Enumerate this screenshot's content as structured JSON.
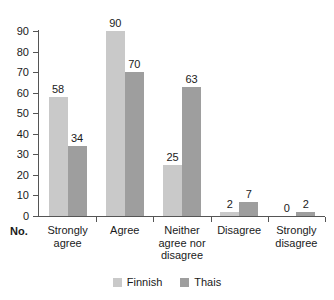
{
  "chart_data": {
    "type": "bar",
    "title": "",
    "subtitle": "",
    "xlabel": "No.",
    "ylabel": "",
    "categories": [
      "Strongly agree",
      "Agree",
      "Neither agree nor disagree",
      "Disagree",
      "Strongly disagree"
    ],
    "category_lines": [
      [
        "Strongly",
        "agree"
      ],
      [
        "Agree"
      ],
      [
        "Neither",
        "agree nor",
        "disagree"
      ],
      [
        "Disagree"
      ],
      [
        "Strongly",
        "disagree"
      ]
    ],
    "series": [
      {
        "name": "Finnish",
        "color": "#c9c9c9",
        "values": [
          58,
          90,
          25,
          2,
          0
        ]
      },
      {
        "name": "Thais",
        "color": "#9e9e9e",
        "values": [
          34,
          70,
          63,
          7,
          2
        ]
      }
    ],
    "ylim": [
      0,
      90
    ],
    "yticks": [
      0,
      10,
      20,
      30,
      40,
      50,
      60,
      70,
      80,
      90
    ],
    "ytick_labels": [
      "0",
      "10",
      "20",
      "30",
      "40",
      "50",
      "60",
      "70",
      "80",
      "90"
    ],
    "grid": false,
    "legend_position": "bottom",
    "data_labels": true
  },
  "legend": {
    "items": [
      {
        "label": "Finnish",
        "color": "#c9c9c9"
      },
      {
        "label": "Thais",
        "color": "#9e9e9e"
      }
    ]
  },
  "axis": {
    "x_name": "No."
  }
}
